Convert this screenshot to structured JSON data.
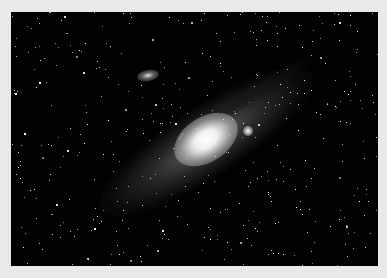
{
  "image": {
    "subject": "Andromeda galaxy star field",
    "alt": "Spiral galaxy seen at an angle with bright core, companion galaxies, dense star field",
    "colors": {
      "border": "#e9e9e9",
      "sky": "#020202",
      "core": "#ffffff"
    }
  }
}
